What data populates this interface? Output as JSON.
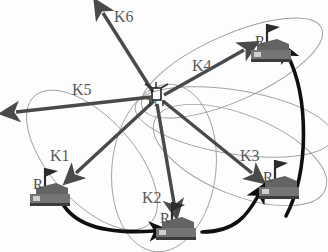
{
  "figure": {
    "type": "diagram",
    "background_color": "#ffffff",
    "beam_arrow_color": "#4a4a4a",
    "motion_arrow_color": "#111111",
    "ellipse_color": "#9a9a9a",
    "vehicle_body_color": "#6e6e6e",
    "vehicle_shadow_color": "#3a3a3a",
    "label_color": "#5a5a5a"
  },
  "hub": {
    "name": "T1",
    "label": "T1",
    "x": 156,
    "y": 96
  },
  "beams": [
    {
      "id": "K1",
      "label": "K1",
      "label_x": 50,
      "label_y": 148,
      "x1": 154,
      "y1": 101,
      "x2": 74,
      "y2": 175,
      "head": 1
    },
    {
      "id": "K2",
      "label": "K2",
      "label_x": 146,
      "label_y": 192,
      "x1": 157,
      "y1": 104,
      "x2": 175,
      "y2": 207,
      "head": 1
    },
    {
      "id": "K3",
      "label": "K3",
      "label_x": 243,
      "label_y": 150,
      "x1": 163,
      "y1": 101,
      "x2": 254,
      "y2": 176,
      "head": 1
    },
    {
      "id": "K4",
      "label": "K4",
      "label_x": 193,
      "label_y": 62,
      "x1": 164,
      "y1": 95,
      "x2": 247,
      "y2": 48,
      "head": 1
    },
    {
      "id": "K5",
      "label": "K5",
      "label_x": 74,
      "label_y": 85,
      "x1": 151,
      "y1": 97,
      "x2": 12,
      "y2": 113,
      "head": 1
    },
    {
      "id": "K6",
      "label": "K6",
      "label_x": 115,
      "label_y": 12,
      "x1": 153,
      "y1": 92,
      "x2": 100,
      "y2": 10,
      "head": 1
    }
  ],
  "vehicles": [
    {
      "id": "R1",
      "label": "R",
      "x": 48,
      "y": 193,
      "beam": "K1"
    },
    {
      "id": "R2",
      "label": "R",
      "x": 174,
      "y": 228,
      "beam": "K2"
    },
    {
      "id": "R3",
      "label": "R",
      "x": 277,
      "y": 187,
      "beam": "K3"
    },
    {
      "id": "R4",
      "label": "R",
      "x": 265,
      "y": 50,
      "beam": "K4"
    }
  ],
  "motion_paths": [
    {
      "id": "path-r1-r2",
      "from": "R1",
      "to": "R2"
    },
    {
      "id": "path-r2-r3",
      "from": "R2",
      "to": "R3"
    },
    {
      "id": "path-r3-r4",
      "from": "R3",
      "to": "R4"
    }
  ],
  "footprints": [
    {
      "id": "footprint-k1",
      "beam": "K1"
    },
    {
      "id": "footprint-k2",
      "beam": "K2"
    },
    {
      "id": "footprint-k3",
      "beam": "K3"
    },
    {
      "id": "footprint-k4",
      "beam": "K4"
    }
  ]
}
